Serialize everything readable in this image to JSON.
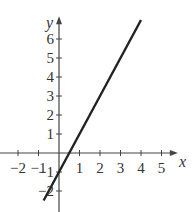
{
  "chart_data": {
    "type": "line",
    "title": "",
    "xlabel": "x",
    "ylabel": "y",
    "xlim": [
      -2.8,
      5.8
    ],
    "ylim": [
      -2.9,
      7.2
    ],
    "x_ticks": [
      -2,
      -1,
      1,
      2,
      3,
      4,
      5
    ],
    "x_tick_labels": [
      "−2",
      "−1",
      "1",
      "2",
      "3",
      "4",
      "5"
    ],
    "y_ticks": [
      -2,
      -1,
      1,
      2,
      3,
      4,
      5,
      6
    ],
    "y_tick_labels": [
      "−2",
      "−1",
      "1",
      "2",
      "3",
      "4",
      "5",
      "6"
    ],
    "grid": false,
    "series": [
      {
        "name": "y = 2x - 1",
        "x": [
          -0.75,
          4
        ],
        "y": [
          -2.5,
          7
        ]
      }
    ],
    "line_color": "#222222"
  }
}
